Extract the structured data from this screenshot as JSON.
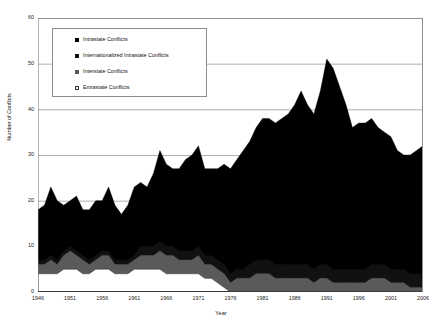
{
  "header": {
    "clipped_text": "·······   ···· ····"
  },
  "legend": {
    "position": "inside-top-left",
    "items": [
      {
        "label": "Intrastate Conflicts",
        "color": "#000000",
        "marker": "filled-square",
        "key": "intrastate"
      },
      {
        "label": "Internationalized Intrastate Conflicts",
        "color": "#111111",
        "marker": "filled-square",
        "key": "internationalized"
      },
      {
        "label": "Interstate Conflicts",
        "color": "#5a5a5a",
        "marker": "filled-square",
        "key": "interstate"
      },
      {
        "label": "Extrastate Conflicts",
        "color": "#ffffff",
        "marker": "open-square",
        "key": "extrastate"
      }
    ]
  },
  "chart_data": {
    "type": "area",
    "stacked": true,
    "title": "",
    "xlabel": "Year",
    "ylabel": "Number of Conflicts",
    "xlim": [
      1946,
      2006
    ],
    "ylim": [
      0,
      60
    ],
    "ytick_step": 10,
    "yticks": [
      0,
      10,
      20,
      30,
      40,
      50,
      60
    ],
    "xticks": [
      1946,
      1951,
      1956,
      1961,
      1966,
      1971,
      1976,
      1981,
      1986,
      1991,
      1996,
      2001,
      2006
    ],
    "grid": "horizontal",
    "x": [
      1946,
      1947,
      1948,
      1949,
      1950,
      1951,
      1952,
      1953,
      1954,
      1955,
      1956,
      1957,
      1958,
      1959,
      1960,
      1961,
      1962,
      1963,
      1964,
      1965,
      1966,
      1967,
      1968,
      1969,
      1970,
      1971,
      1972,
      1973,
      1974,
      1975,
      1976,
      1977,
      1978,
      1979,
      1980,
      1981,
      1982,
      1983,
      1984,
      1985,
      1986,
      1987,
      1988,
      1989,
      1990,
      1991,
      1992,
      1993,
      1994,
      1995,
      1996,
      1997,
      1998,
      1999,
      2000,
      2001,
      2002,
      2003,
      2004,
      2005,
      2006
    ],
    "series": [
      {
        "name": "Extrastate Conflicts",
        "key": "extrastate",
        "color": "#ffffff",
        "stack_order": 1,
        "values": [
          4,
          4,
          4,
          4,
          5,
          5,
          5,
          4,
          4,
          5,
          5,
          5,
          4,
          4,
          4,
          5,
          5,
          5,
          5,
          5,
          4,
          4,
          4,
          4,
          4,
          4,
          3,
          3,
          2,
          1,
          0,
          0,
          0,
          0,
          0,
          0,
          0,
          0,
          0,
          0,
          0,
          0,
          0,
          0,
          0,
          0,
          0,
          0,
          0,
          0,
          0,
          0,
          0,
          0,
          0,
          0,
          0,
          0,
          0,
          0,
          0
        ]
      },
      {
        "name": "Interstate Conflicts",
        "key": "interstate",
        "color": "#5a5a5a",
        "stack_order": 2,
        "values": [
          2,
          2,
          3,
          2,
          3,
          4,
          3,
          3,
          2,
          2,
          3,
          3,
          2,
          2,
          2,
          2,
          3,
          3,
          3,
          4,
          4,
          4,
          3,
          3,
          3,
          4,
          3,
          3,
          3,
          3,
          2,
          3,
          3,
          3,
          4,
          4,
          4,
          3,
          3,
          3,
          3,
          3,
          3,
          2,
          3,
          3,
          2,
          2,
          2,
          2,
          2,
          2,
          3,
          3,
          3,
          2,
          2,
          2,
          1,
          1,
          1
        ]
      },
      {
        "name": "Internationalized Intrastate Conflicts",
        "key": "internationalized",
        "color": "#111111",
        "stack_order": 3,
        "values": [
          1,
          1,
          1,
          1,
          1,
          1,
          1,
          1,
          1,
          1,
          1,
          1,
          1,
          1,
          1,
          1,
          2,
          2,
          2,
          2,
          2,
          2,
          2,
          2,
          2,
          2,
          2,
          2,
          2,
          2,
          2,
          2,
          2,
          3,
          3,
          3,
          3,
          3,
          3,
          3,
          3,
          3,
          3,
          3,
          3,
          3,
          3,
          3,
          3,
          3,
          3,
          3,
          3,
          3,
          3,
          3,
          3,
          3,
          3,
          3,
          3
        ]
      },
      {
        "name": "Intrastate Conflicts",
        "key": "intrastate",
        "color": "#000000",
        "stack_order": 4,
        "values": [
          11,
          12,
          15,
          13,
          10,
          10,
          12,
          10,
          11,
          12,
          11,
          14,
          12,
          10,
          12,
          15,
          14,
          13,
          16,
          20,
          18,
          17,
          18,
          20,
          21,
          22,
          19,
          19,
          20,
          22,
          23,
          24,
          26,
          27,
          29,
          31,
          31,
          31,
          32,
          33,
          35,
          38,
          35,
          34,
          38,
          45,
          44,
          40,
          36,
          31,
          32,
          32,
          32,
          30,
          29,
          29,
          26,
          25,
          26,
          27,
          28
        ]
      }
    ],
    "totals": [
      18,
      19,
      23,
      20,
      19,
      20,
      21,
      18,
      18,
      20,
      20,
      23,
      19,
      17,
      19,
      23,
      24,
      23,
      26,
      31,
      28,
      27,
      27,
      29,
      30,
      32,
      27,
      27,
      27,
      28,
      27,
      29,
      31,
      33,
      36,
      38,
      38,
      37,
      38,
      39,
      41,
      44,
      41,
      39,
      44,
      51,
      49,
      45,
      41,
      36,
      37,
      37,
      38,
      36,
      35,
      34,
      31,
      30,
      30,
      31,
      32
    ],
    "peak": {
      "year": 1991,
      "value": 51
    }
  }
}
